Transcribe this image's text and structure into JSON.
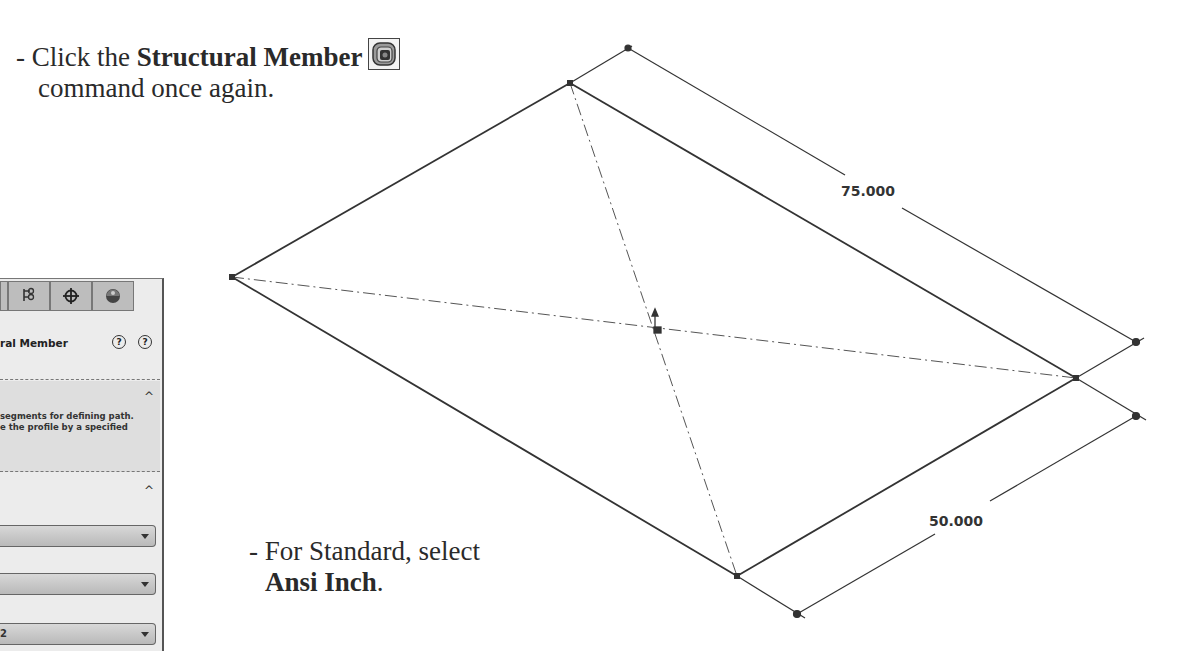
{
  "instructions": [
    {
      "prefix": "- Click the ",
      "bold": "Structural Member",
      "line2": "command once again.",
      "icon": "structural-member-icon"
    },
    {
      "prefix": "- For Standard, select",
      "bold": "Ansi Inch",
      "suffix": "."
    }
  ],
  "property_manager": {
    "tabs": [
      "feature-manager-tab",
      "configuration-manager-tab",
      "dimxpert-tab",
      "display-manager-tab"
    ],
    "title": "ral Member",
    "help_icons": [
      "detailed-help-icon",
      "help-icon"
    ],
    "message_section": {
      "line1": "segments for defining path.",
      "line2": "e the profile by a specified",
      "collapse_glyph": "^"
    },
    "selections_section": {
      "collapse_glyph": "^",
      "dropdowns": [
        {
          "value": ""
        },
        {
          "value": ""
        },
        {
          "value": "2"
        }
      ]
    }
  },
  "sketch": {
    "dimensions": [
      {
        "label": "75.000",
        "edge": "top-right"
      },
      {
        "label": "50.000",
        "edge": "bottom-right"
      }
    ],
    "colors": {
      "line": "#3a3a3a",
      "panel": "#ececec",
      "dropdown": "#c6c6c6"
    }
  }
}
